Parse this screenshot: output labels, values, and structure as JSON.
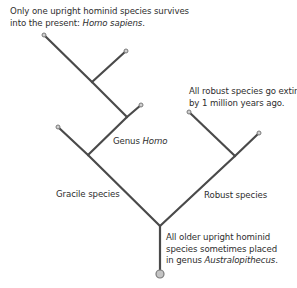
{
  "diagram": {
    "type": "phylogenetic-tree",
    "colors": {
      "branch": "#4a4a4a",
      "node_fill": "#cfcfcf",
      "node_stroke": "#7a7a7a",
      "root_fill": "#c4c4c4",
      "text": "#2e2e2e"
    },
    "annotations": {
      "top": {
        "line1": "Only one upright hominid species survives",
        "line2_prefix": "into the present: ",
        "line2_italic": "Homo sapiens",
        "line2_suffix": "."
      },
      "robust_extinct": {
        "line1": "All robust species go extinct",
        "line2": "by 1 million years ago."
      },
      "genus_homo": {
        "prefix": "Genus ",
        "italic": "Homo"
      },
      "gracile": {
        "text": "Gracile species"
      },
      "robust": {
        "text": "Robust species"
      },
      "older": {
        "line1": "All older upright hominid",
        "line2": "species sometimes placed",
        "line3_prefix": "in genus ",
        "line3_italic": "Australopithecus",
        "line3_suffix": "."
      }
    },
    "nodes": {
      "root": [
        160,
        274
      ],
      "base_split": [
        160,
        226
      ],
      "gracile_node": [
        88,
        155
      ],
      "homo_node_lower": [
        127,
        117
      ],
      "homo_node_upper": [
        92,
        82
      ],
      "robust_node": [
        235,
        156
      ],
      "leaf_homo_sapiens": [
        44,
        35
      ],
      "leaf_homo_upper": [
        126,
        51
      ],
      "leaf_homo_lower": [
        141,
        105
      ],
      "leaf_gracile": [
        58,
        127
      ],
      "leaf_robust_left": [
        189,
        112
      ],
      "leaf_robust_right": [
        259,
        133
      ]
    },
    "edges": [
      [
        "root",
        "base_split"
      ],
      [
        "base_split",
        "gracile_node"
      ],
      [
        "base_split",
        "robust_node"
      ],
      [
        "gracile_node",
        "leaf_gracile"
      ],
      [
        "gracile_node",
        "homo_node_lower"
      ],
      [
        "homo_node_lower",
        "leaf_homo_lower"
      ],
      [
        "homo_node_lower",
        "homo_node_upper"
      ],
      [
        "homo_node_upper",
        "leaf_homo_upper"
      ],
      [
        "homo_node_upper",
        "leaf_homo_sapiens"
      ],
      [
        "robust_node",
        "leaf_robust_left"
      ],
      [
        "robust_node",
        "leaf_robust_right"
      ]
    ],
    "leaves": [
      "leaf_homo_sapiens",
      "leaf_homo_upper",
      "leaf_homo_lower",
      "leaf_gracile",
      "leaf_robust_left",
      "leaf_robust_right"
    ]
  }
}
